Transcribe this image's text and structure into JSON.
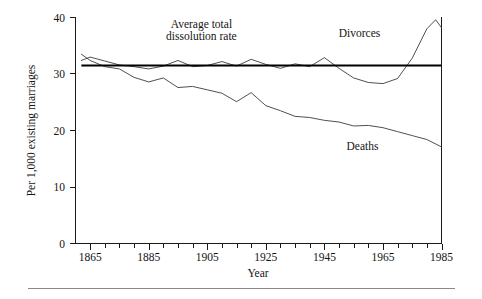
{
  "figure": {
    "background_color": "#ffffff",
    "ink_color": "#1a1a1a",
    "line_color": "#3c3c3c",
    "reference_line_color": "#000000",
    "footer_rule_color": "#8a8a8a"
  },
  "chart_data": {
    "type": "line",
    "title": "",
    "xlabel": "Year",
    "ylabel": "Per 1,000 existing marriages",
    "xlim": [
      1860,
      1985
    ],
    "ylim": [
      0,
      40
    ],
    "grid": false,
    "legend_position": "inline-annotations",
    "y_ticks": [
      0,
      10,
      20,
      30,
      40
    ],
    "y_tick_labels": [
      "0",
      "10",
      "20",
      "30",
      "40"
    ],
    "x_ticks_major": [
      1865,
      1885,
      1905,
      1925,
      1945,
      1965,
      1985
    ],
    "x_tick_labels": [
      "1865",
      "1885",
      "1905",
      "1925",
      "1945",
      "1965",
      "1985"
    ],
    "x_ticks_minor": [
      1870,
      1875,
      1880,
      1890,
      1895,
      1900,
      1910,
      1915,
      1920,
      1930,
      1935,
      1940,
      1950,
      1955,
      1960,
      1970,
      1975,
      1980
    ],
    "series": [
      {
        "name": "Divorces",
        "label": "Divorces",
        "label_x": 1957,
        "label_y": 36.6,
        "x": [
          1862,
          1865,
          1870,
          1875,
          1880,
          1885,
          1890,
          1895,
          1900,
          1905,
          1910,
          1915,
          1920,
          1925,
          1930,
          1935,
          1940,
          1945,
          1950,
          1955,
          1960,
          1965,
          1970,
          1975,
          1980,
          1983,
          1985
        ],
        "values": [
          32.4,
          33.0,
          32.3,
          31.6,
          31.3,
          30.9,
          31.4,
          32.4,
          31.3,
          31.5,
          32.2,
          31.4,
          32.6,
          31.7,
          31.0,
          31.8,
          31.3,
          32.9,
          31.0,
          29.3,
          28.5,
          28.3,
          29.2,
          32.8,
          38.0,
          39.6,
          38.2
        ]
      },
      {
        "name": "Deaths",
        "label": "Deaths",
        "label_x": 1958,
        "label_y": 16.6,
        "x": [
          1862,
          1865,
          1870,
          1875,
          1880,
          1885,
          1890,
          1895,
          1900,
          1905,
          1910,
          1915,
          1920,
          1925,
          1930,
          1935,
          1940,
          1945,
          1950,
          1955,
          1960,
          1965,
          1970,
          1975,
          1980,
          1985
        ],
        "values": [
          33.5,
          32.4,
          31.3,
          30.9,
          29.4,
          28.6,
          29.3,
          27.6,
          27.8,
          27.2,
          26.6,
          25.1,
          26.7,
          24.4,
          23.5,
          22.5,
          22.3,
          21.8,
          21.5,
          20.8,
          20.9,
          20.5,
          19.8,
          19.1,
          18.4,
          17.1
        ]
      }
    ],
    "annotations": [
      {
        "name": "average-total-dissolution-rate",
        "type": "horizontal-reference-line",
        "value": 31.5,
        "x_start": 1862,
        "x_end": 1985,
        "label_line1": "Average total",
        "label_line2": "dissolution rate",
        "label_x": 1903,
        "label_y_line1": 38.2,
        "label_y_line2": 36.0
      }
    ]
  }
}
